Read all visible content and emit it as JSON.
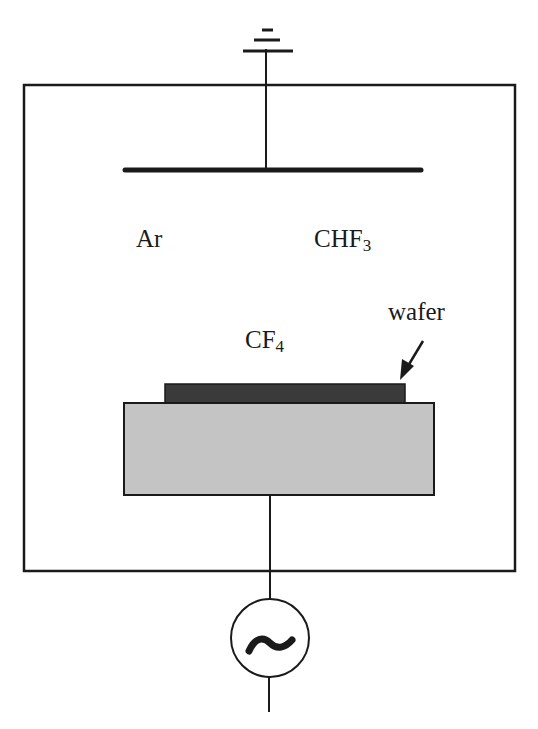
{
  "diagram": {
    "type": "reactive-ion-etch-chamber",
    "labels": {
      "gas_ar": "Ar",
      "gas_chf3_base": "CHF",
      "gas_chf3_sub": "3",
      "gas_cf4_base": "CF",
      "gas_cf4_sub": "4",
      "wafer": "wafer"
    },
    "components": {
      "ground_symbol": "ground-icon",
      "top_electrode": "grounded upper electrode",
      "chamber": "chamber outline",
      "wafer": "wafer",
      "bottom_electrode": "substrate electrode",
      "rf_source": "ac-source-icon",
      "rf_glyph": "~"
    },
    "colors": {
      "line": "#1a1a1a",
      "wafer_fill": "#3a3a3a",
      "electrode_fill": "#c4c4c4",
      "background": "#ffffff"
    }
  }
}
